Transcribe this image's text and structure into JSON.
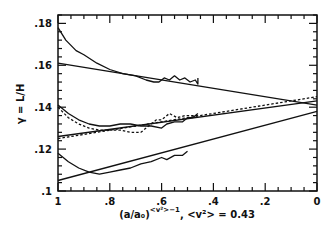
{
  "chart_data": {
    "type": "line",
    "title": "",
    "xlabel": "(a/a₀)^(<v²>−1), <v²> = 0.43",
    "xlabel_parts": {
      "base": "(a/a₀)",
      "exponent": "<v²>−1",
      "suffix": ", <v²> = 0.43"
    },
    "ylabel": "γ = L/H",
    "xlim": [
      1,
      0
    ],
    "ylim": [
      0.1,
      0.184
    ],
    "x_ticks": [
      "1",
      ".8",
      ".6",
      ".4",
      ".2",
      "0"
    ],
    "x_tick_values": [
      1,
      0.8,
      0.6,
      0.4,
      0.2,
      0
    ],
    "y_ticks": [
      ".1",
      ".12",
      ".14",
      ".16",
      ".18"
    ],
    "y_tick_values": [
      0.1,
      0.12,
      0.14,
      0.16,
      0.18
    ],
    "grid": false,
    "legend": null,
    "series": [
      {
        "name": "upper-data",
        "style": "solid",
        "x": [
          1,
          0.97,
          0.93,
          0.9,
          0.85,
          0.8,
          0.75,
          0.7,
          0.66,
          0.63,
          0.61,
          0.59,
          0.57,
          0.55,
          0.53,
          0.51,
          0.49,
          0.47,
          0.46,
          0.46
        ],
        "y": [
          0.178,
          0.172,
          0.167,
          0.165,
          0.161,
          0.158,
          0.156,
          0.155,
          0.153,
          0.152,
          0.152,
          0.154,
          0.153,
          0.155,
          0.153,
          0.154,
          0.152,
          0.153,
          0.151,
          0.154
        ]
      },
      {
        "name": "upper-fit",
        "style": "solid",
        "x": [
          1,
          0
        ],
        "y": [
          0.161,
          0.141
        ]
      },
      {
        "name": "middle-data",
        "style": "solid",
        "x": [
          1,
          0.96,
          0.92,
          0.88,
          0.84,
          0.8,
          0.76,
          0.72,
          0.68,
          0.64,
          0.6,
          0.58,
          0.55,
          0.52,
          0.5,
          0.48,
          0.46
        ],
        "y": [
          0.141,
          0.137,
          0.134,
          0.132,
          0.131,
          0.131,
          0.132,
          0.132,
          0.131,
          0.131,
          0.13,
          0.132,
          0.133,
          0.133,
          0.135,
          0.135,
          0.137
        ]
      },
      {
        "name": "middle-data-dotted",
        "style": "dotted",
        "x": [
          1,
          0.96,
          0.92,
          0.88,
          0.84,
          0.8,
          0.76,
          0.72,
          0.68,
          0.65,
          0.62,
          0.6,
          0.57,
          0.54,
          0.51,
          0.48,
          0.46
        ],
        "y": [
          0.14,
          0.135,
          0.132,
          0.13,
          0.129,
          0.129,
          0.129,
          0.128,
          0.128,
          0.131,
          0.134,
          0.134,
          0.137,
          0.135,
          0.136,
          0.136,
          0.136
        ]
      },
      {
        "name": "middle-fit",
        "style": "solid",
        "x": [
          1,
          0
        ],
        "y": [
          0.126,
          0.143
        ]
      },
      {
        "name": "middle-fit-dotted",
        "style": "dotted",
        "x": [
          1,
          0
        ],
        "y": [
          0.125,
          0.145
        ]
      },
      {
        "name": "lower-data",
        "style": "solid",
        "x": [
          1,
          0.96,
          0.92,
          0.88,
          0.84,
          0.8,
          0.76,
          0.72,
          0.68,
          0.64,
          0.6,
          0.58,
          0.55,
          0.52,
          0.5
        ],
        "y": [
          0.118,
          0.114,
          0.111,
          0.109,
          0.108,
          0.109,
          0.11,
          0.111,
          0.113,
          0.114,
          0.116,
          0.115,
          0.117,
          0.117,
          0.119
        ]
      },
      {
        "name": "lower-fit",
        "style": "solid",
        "x": [
          1,
          0
        ],
        "y": [
          0.105,
          0.138
        ]
      }
    ]
  }
}
